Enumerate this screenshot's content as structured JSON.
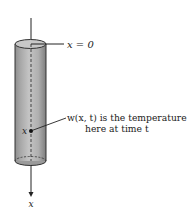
{
  "diagram": {
    "type": "cylinder-rod-temperature",
    "labels": {
      "origin": "x = 0",
      "point": "x",
      "annotation_line1": "w(x, t) is the temperature",
      "annotation_line2": "here at time t",
      "axis": "x"
    },
    "colors": {
      "rod_fill": "#b4b4b4",
      "rod_top": "#c8c8c8",
      "rod_dark": "#8a8a8a",
      "line": "#222222"
    }
  }
}
